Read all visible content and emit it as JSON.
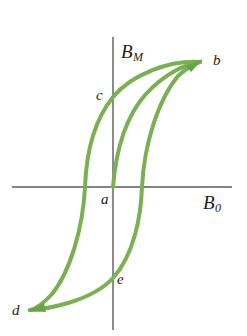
{
  "figure": {
    "background_color": "#ffffff",
    "width": 247,
    "height": 336
  },
  "axes": {
    "line_color": "#5a5a5a",
    "y_axis": {
      "label_base": "B",
      "label_sub": "M",
      "x": 113,
      "y_top": 37,
      "y_bottom": 330
    },
    "x_axis": {
      "label_base": "B",
      "label_sub": "0",
      "y": 187,
      "x_left": 12,
      "x_right": 232
    }
  },
  "curve": {
    "color": "#7aaf53",
    "stroke_width": 4,
    "arrow_color": "#6aa347"
  },
  "points": [
    {
      "id": "a",
      "label": "a",
      "x": 113,
      "y": 187,
      "note": "origin / unmagnetized start"
    },
    {
      "id": "b",
      "label": "b",
      "x": 200,
      "y": 62,
      "note": "positive saturation"
    },
    {
      "id": "c",
      "label": "c",
      "x": 113,
      "y": 97,
      "note": "positive remanence"
    },
    {
      "id": "d",
      "label": "d",
      "x": 30,
      "y": 310,
      "note": "negative saturation"
    },
    {
      "id": "e",
      "label": "e",
      "x": 113,
      "y": 278,
      "note": "negative remanence"
    }
  ],
  "chart_data": {
    "type": "line",
    "xlabel": "B_0",
    "ylabel": "B_M",
    "grid": false,
    "legend": "none",
    "xlim": [
      12,
      232
    ],
    "ylim": [
      330,
      37
    ],
    "annotations": [
      {
        "text": "a",
        "x": 113,
        "y": 187
      },
      {
        "text": "b",
        "x": 200,
        "y": 62
      },
      {
        "text": "c",
        "x": 113,
        "y": 97
      },
      {
        "text": "d",
        "x": 30,
        "y": 310
      },
      {
        "text": "e",
        "x": 113,
        "y": 278
      }
    ],
    "series": [
      {
        "name": "initial-magnetization-curve",
        "from": "a",
        "to": "b",
        "path": "M 113 187 C 116 150 125 118 145 95 C 165 73 186 64 200 62"
      },
      {
        "name": "descending-branch",
        "from": "b",
        "through": [
          "c"
        ],
        "to": "d",
        "path": "M 200 62 C 170 60 132 74 113 97 C 92 123 86 160 85 187 C 83 228 70 272 52 294 C 42 305 35 309 30 310"
      },
      {
        "name": "ascending-branch",
        "from": "d",
        "through": [
          "e"
        ],
        "to": "b",
        "path": "M 30 310 C 48 309 92 301 113 278 C 134 255 141 216 142 187 C 144 145 158 100 178 76 C 189 66 196 63 200 62"
      }
    ],
    "arrowheads": [
      {
        "at": "b",
        "x": 200,
        "y": 62,
        "direction": "up-right"
      },
      {
        "at": "d",
        "x": 30,
        "y": 310,
        "direction": "left"
      }
    ]
  }
}
